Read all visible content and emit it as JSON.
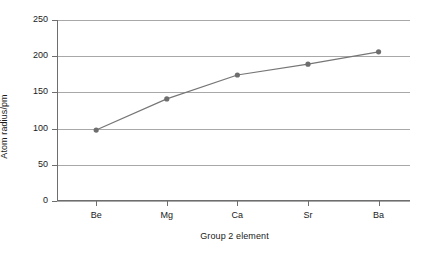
{
  "chart_data": {
    "type": "line",
    "title": "",
    "xlabel": "Group 2 element",
    "ylabel": "Atom radius/pm",
    "categories": [
      "Be",
      "Mg",
      "Ca",
      "Sr",
      "Ba"
    ],
    "values": [
      98,
      141,
      174,
      189,
      206
    ],
    "series": [
      {
        "name": "Atom radius",
        "values": [
          98,
          141,
          174,
          189,
          206
        ]
      }
    ],
    "ylim": [
      0,
      250
    ],
    "yticks": [
      0,
      50,
      100,
      150,
      200,
      250
    ],
    "ytick_labels": [
      "0",
      "50",
      "100",
      "150",
      "200",
      "250"
    ],
    "xtick_labels": [
      "Be",
      "Mg",
      "Ca",
      "Sr",
      "Ba"
    ],
    "grid": "horizontal",
    "legend": "none",
    "marker": "circle",
    "colors": {
      "line": "#767676",
      "marker": "#6e6e6e",
      "gridline": "#a8a8a8",
      "axis": "#6e6e6e",
      "text": "#1a1a1a",
      "background": "#ffffff"
    }
  }
}
